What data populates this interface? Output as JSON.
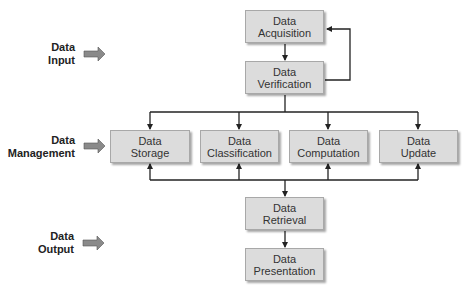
{
  "stages": [
    {
      "label_line1": "Data",
      "label_line2": "Input"
    },
    {
      "label_line1": "Data",
      "label_line2": "Management"
    },
    {
      "label_line1": "Data",
      "label_line2": "Output"
    }
  ],
  "nodes": {
    "acquisition": {
      "line1": "Data",
      "line2": "Acquisition"
    },
    "verification": {
      "line1": "Data",
      "line2": "Verification"
    },
    "storage": {
      "line1": "Data",
      "line2": "Storage"
    },
    "classification": {
      "line1": "Data",
      "line2": "Classification"
    },
    "computation": {
      "line1": "Data",
      "line2": "Computation"
    },
    "update": {
      "line1": "Data",
      "line2": "Update"
    },
    "retrieval": {
      "line1": "Data",
      "line2": "Retrieval"
    },
    "presentation": {
      "line1": "Data",
      "line2": "Presentation"
    }
  },
  "colors": {
    "box_fill": "#dcdcdc",
    "box_border": "#a8a8a8",
    "stage_arrow": "#808080",
    "line": "#222222"
  }
}
